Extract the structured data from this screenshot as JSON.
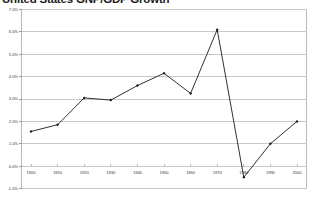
{
  "chart_data": {
    "type": "line",
    "title": "United States GNP/GDP Growth",
    "xlabel": "",
    "ylabel": "",
    "x": [
      1900,
      1910,
      1920,
      1930,
      1940,
      1950,
      1960,
      1970,
      1980,
      1990,
      2000
    ],
    "categories": [
      "1900",
      "1910",
      "1920",
      "1930",
      "1940",
      "1950",
      "1960",
      "1970",
      "1980",
      "1990",
      "2000"
    ],
    "values": [
      1.55,
      1.85,
      3.05,
      2.95,
      3.6,
      4.15,
      3.25,
      6.1,
      -0.5,
      1.0,
      2.0
    ],
    "series": [
      {
        "name": "Growth rate",
        "values": [
          1.55,
          1.85,
          3.05,
          2.95,
          3.6,
          4.15,
          3.25,
          6.1,
          -0.5,
          1.0,
          2.0
        ]
      }
    ],
    "ylim": [
      -1.0,
      7.0
    ],
    "ytick_labels": [
      "7.0%",
      "6.0%",
      "5.0%",
      "4.0%",
      "3.0%",
      "2.0%",
      "1.0%",
      "0.0%",
      "-1.0%"
    ],
    "ytick_values": [
      7.0,
      6.0,
      5.0,
      4.0,
      3.0,
      2.0,
      1.0,
      0.0,
      -1.0
    ],
    "xtick_labels": [
      "1900",
      "1910",
      "1920",
      "1930",
      "1940",
      "1950",
      "1960",
      "1970",
      "1980",
      "1990",
      "2000"
    ],
    "grid": true,
    "grid_axis": "y",
    "legend": false,
    "legend_position": "none",
    "marker": "diamond",
    "line_color": "#1a1a1a",
    "marker_color": "#1a1a1a",
    "grid_color": "#c8c8c8",
    "frame_color": "#b9b9b9",
    "background_color": "#ffffff"
  }
}
